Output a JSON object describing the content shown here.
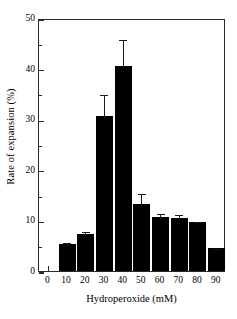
{
  "chart_data": {
    "type": "bar",
    "title": "",
    "xlabel": "Hydroperoxide (mM)",
    "ylabel": "Rate of expansion (%)",
    "categories": [
      "0",
      "10",
      "20",
      "30",
      "40",
      "50",
      "60",
      "70",
      "80",
      "90"
    ],
    "values": [
      0,
      5.3,
      7.3,
      30.6,
      40.5,
      13.3,
      10.7,
      10.5,
      9.7,
      4.5
    ],
    "errors": [
      0,
      0.6,
      0.8,
      4.5,
      5.5,
      2.3,
      1.0,
      0.9,
      0.4,
      0.3
    ],
    "xlim": [
      -5,
      95
    ],
    "ylim": [
      0,
      50
    ],
    "yticks": [
      0,
      10,
      20,
      30,
      40,
      50
    ],
    "yticklabels": [
      "0",
      "10",
      "20",
      "30",
      "40",
      "50"
    ],
    "yminorticks": [
      5,
      15,
      25,
      35,
      45
    ],
    "xticks": [
      0,
      10,
      20,
      30,
      40,
      50,
      60,
      70,
      80,
      90
    ],
    "xticklabels": [
      "0",
      "10",
      "20",
      "30",
      "40",
      "50",
      "60",
      "70",
      "80",
      "90"
    ],
    "grid": false,
    "legend": null,
    "bar_color": "#000000",
    "error_color": "#1a1a1a",
    "axis_color": "#2b2b2b",
    "background": "#ffffff"
  }
}
